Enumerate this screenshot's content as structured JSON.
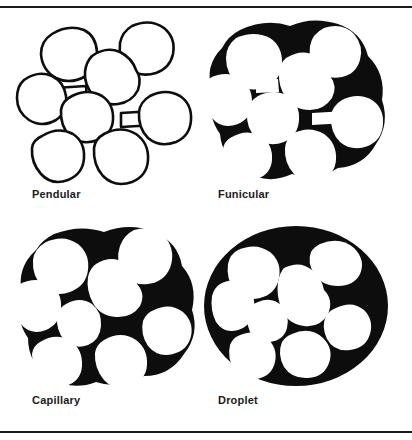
{
  "figure": {
    "background_color": "#ffffff",
    "ink_color": "#0d0d0d",
    "top_rule": true,
    "bottom_rule": true
  },
  "panels": [
    {
      "id": "pendular",
      "label": "Pendular",
      "description": "Discrete white particles in contact, joined by small liquid bridges at the contact points; voids remain empty (white).",
      "liquid_fill": "bridges-only",
      "particle_count": 8,
      "particle_fill": "#ffffff",
      "liquid_fill_color": "#0d0d0d"
    },
    {
      "id": "funicular",
      "label": "Funicular",
      "description": "Particles partly surrounded by continuous liquid; voids partially filled with black liquid, some air pockets remain.",
      "liquid_fill": "partial",
      "particle_count": 8,
      "particle_fill": "#ffffff",
      "liquid_fill_color": "#0d0d0d"
    },
    {
      "id": "capillary",
      "label": "Capillary",
      "description": "All interior voids completely filled with liquid (solid black), outer surface follows the particle contours.",
      "liquid_fill": "complete",
      "particle_count": 8,
      "particle_fill": "#ffffff",
      "liquid_fill_color": "#0d0d0d"
    },
    {
      "id": "droplet",
      "label": "Droplet",
      "description": "Particles fully suspended inside a single large liquid droplet forming a smooth black ellipse.",
      "liquid_fill": "droplet",
      "particle_count": 8,
      "particle_fill": "#ffffff",
      "liquid_fill_color": "#0d0d0d"
    }
  ]
}
